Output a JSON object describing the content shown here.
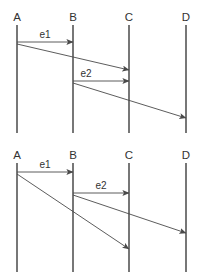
{
  "figure": {
    "background_color": "#ffffff",
    "line_color": "#555555",
    "arrow_color": "#4a4a4a",
    "text_color": "#333333"
  },
  "diagrams": [
    {
      "id": "diagram-top",
      "participants": [
        {
          "label": "A",
          "x": 17,
          "label_x": 17,
          "label_y": 21
        },
        {
          "label": "B",
          "x": 73,
          "label_x": 73,
          "label_y": 21
        },
        {
          "label": "C",
          "x": 129,
          "label_x": 129,
          "label_y": 21
        },
        {
          "label": "D",
          "x": 186,
          "label_x": 186,
          "label_y": 21
        }
      ],
      "lifeline_top": 25,
      "lifeline_bottom": 133,
      "messages": [
        {
          "name": "e1",
          "from": "A",
          "to": "B",
          "x1": 17,
          "y1": 42,
          "x2": 73,
          "y2": 42,
          "label": "e1",
          "label_x": 45,
          "label_y": 38
        },
        {
          "name": "a-to-c",
          "from": "A",
          "to": "C",
          "x1": 17,
          "y1": 44,
          "x2": 129,
          "y2": 70,
          "label": "",
          "label_x": 0,
          "label_y": 0
        },
        {
          "name": "e2",
          "from": "B",
          "to": "C",
          "x1": 73,
          "y1": 81,
          "x2": 129,
          "y2": 81,
          "label": "e2",
          "label_x": 86,
          "label_y": 77
        },
        {
          "name": "b-to-d",
          "from": "B",
          "to": "D",
          "x1": 73,
          "y1": 83,
          "x2": 186,
          "y2": 118,
          "label": "",
          "label_x": 0,
          "label_y": 0
        }
      ]
    },
    {
      "id": "diagram-bottom",
      "participants": [
        {
          "label": "A",
          "x": 17,
          "label_x": 17,
          "label_y": 159
        },
        {
          "label": "B",
          "x": 73,
          "label_x": 73,
          "label_y": 159
        },
        {
          "label": "C",
          "x": 129,
          "label_x": 129,
          "label_y": 159
        },
        {
          "label": "D",
          "x": 186,
          "label_x": 186,
          "label_y": 159
        }
      ],
      "lifeline_top": 163,
      "lifeline_bottom": 272,
      "messages": [
        {
          "name": "e1",
          "from": "A",
          "to": "B",
          "x1": 17,
          "y1": 172,
          "x2": 73,
          "y2": 172,
          "label": "e1",
          "label_x": 45,
          "label_y": 168
        },
        {
          "name": "a-to-c",
          "from": "A",
          "to": "C",
          "x1": 17,
          "y1": 174,
          "x2": 129,
          "y2": 249,
          "label": "",
          "label_x": 0,
          "label_y": 0
        },
        {
          "name": "e2",
          "from": "B",
          "to": "C",
          "x1": 73,
          "y1": 193,
          "x2": 129,
          "y2": 193,
          "label": "e2",
          "label_x": 101,
          "label_y": 189
        },
        {
          "name": "b-to-d",
          "from": "B",
          "to": "D",
          "x1": 73,
          "y1": 195,
          "x2": 186,
          "y2": 233,
          "label": "",
          "label_x": 0,
          "label_y": 0
        }
      ]
    }
  ]
}
